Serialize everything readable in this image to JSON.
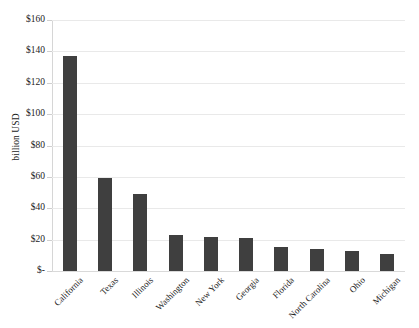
{
  "chart_data": {
    "type": "bar",
    "title": "",
    "xlabel": "",
    "ylabel": "billion USD",
    "categories": [
      "California",
      "Texas",
      "Illinois",
      "Washington",
      "New York",
      "Georgia",
      "Florida",
      "North Carolina",
      "Ohio",
      "Michigan"
    ],
    "values": [
      137,
      59,
      49,
      23,
      22,
      21,
      15,
      14,
      13,
      11
    ],
    "ylim": [
      0,
      160
    ],
    "ytick_values": [
      0,
      20,
      40,
      60,
      80,
      100,
      120,
      140,
      160
    ],
    "ytick_labels": [
      "$-",
      "$20",
      "$40",
      "$60",
      "$80",
      "$100",
      "$120",
      "$140",
      "$160"
    ],
    "grid": true,
    "legend": "none",
    "bar_color": "#3f3f3f",
    "gridline_color": "#e9e9e9",
    "axis_color": "#d6d6d6",
    "text_color": "#1c1c1c",
    "background": "#ffffff"
  }
}
